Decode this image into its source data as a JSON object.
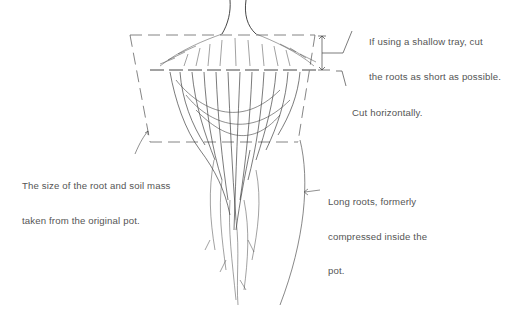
{
  "diagram": {
    "type": "illustration",
    "annotations": [
      {
        "id": "shallow-tray",
        "line1": "If using a shallow tray, cut",
        "line2": "the roots as short as possible."
      },
      {
        "id": "cut-horizontally",
        "line1": "Cut horizontally."
      },
      {
        "id": "root-soil-mass",
        "line1": "The size of the root and soil mass",
        "line2": "taken from the original pot."
      },
      {
        "id": "long-roots",
        "line1": "Long roots, formerly",
        "line2": "compressed inside the",
        "line3": "pot."
      }
    ],
    "colors": {
      "ink": "#333333",
      "text": "#555555",
      "background": "#ffffff"
    }
  }
}
